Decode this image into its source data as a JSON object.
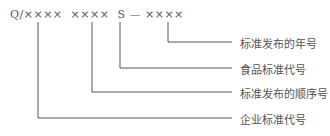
{
  "diagram": {
    "code": "Q/××××  ××××  S — ××××",
    "labels": [
      {
        "text": "标准发布的年号",
        "y": 42
      },
      {
        "text": "食品标准代号",
        "y": 68
      },
      {
        "text": "标准发布的顺序号",
        "y": 92
      },
      {
        "text": "企业标准代号",
        "y": 118
      }
    ],
    "line_color": "#555555"
  }
}
